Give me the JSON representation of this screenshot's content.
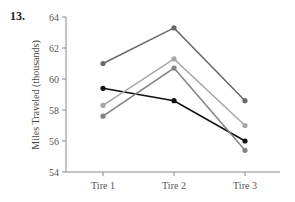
{
  "problem": {
    "number": "13."
  },
  "chart_data": {
    "type": "line",
    "title": "",
    "xlabel": "",
    "ylabel": "Miles Traveled (thousands)",
    "categories": [
      "Tire 1",
      "Tire 2",
      "Tire 3"
    ],
    "ylim": [
      54,
      64
    ],
    "yticks": [
      54,
      56,
      58,
      60,
      62,
      64
    ],
    "grid": false,
    "legend": "none",
    "series": [
      {
        "name": "Series A (dark gray)",
        "color": "#6a6a6a",
        "values": [
          61.0,
          63.3,
          58.6
        ]
      },
      {
        "name": "Series B (black)",
        "color": "#111111",
        "values": [
          59.4,
          58.6,
          56.0
        ]
      },
      {
        "name": "Series C (light gray)",
        "color": "#a8a8a8",
        "values": [
          58.3,
          61.3,
          57.0
        ]
      },
      {
        "name": "Series D (medium gray)",
        "color": "#848484",
        "values": [
          57.6,
          60.7,
          55.4
        ]
      }
    ]
  }
}
